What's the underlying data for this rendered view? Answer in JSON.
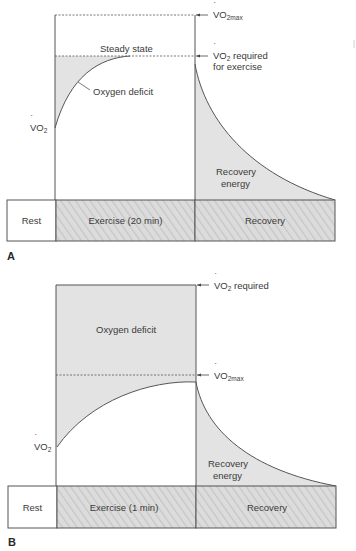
{
  "colors": {
    "line": "#555555",
    "fill": "#e3e3e3",
    "hatch_bg": "#dcdcdc",
    "hatch_line": "#c4c4c4",
    "text": "#3a3a3a"
  },
  "panel_a": {
    "letter": "A",
    "vo2_label": "VO",
    "vo2_sub": "2",
    "vo2max_label": "VO",
    "vo2max_sub": "2max",
    "required_label_1": "VO",
    "required_sub": "2",
    "required_label_rest": " required",
    "required_label_2": "for exercise",
    "steady_state": "Steady state",
    "oxygen_deficit": "Oxygen deficit",
    "recovery_energy_1": "Recovery",
    "recovery_energy_2": "energy",
    "timeline": {
      "rest": "Rest",
      "exercise": "Exercise (20 min)",
      "recovery": "Recovery"
    }
  },
  "panel_b": {
    "letter": "B",
    "vo2_label": "VO",
    "vo2_sub": "2",
    "required_label": "VO",
    "required_sub": "2",
    "required_rest": " required",
    "vo2max_label": "VO",
    "vo2max_sub": "2max",
    "oxygen_deficit": "Oxygen deficit",
    "recovery_energy_1": "Recovery",
    "recovery_energy_2": "energy",
    "timeline": {
      "rest": "Rest",
      "exercise": "Exercise (1 min)",
      "recovery": "Recovery"
    }
  }
}
